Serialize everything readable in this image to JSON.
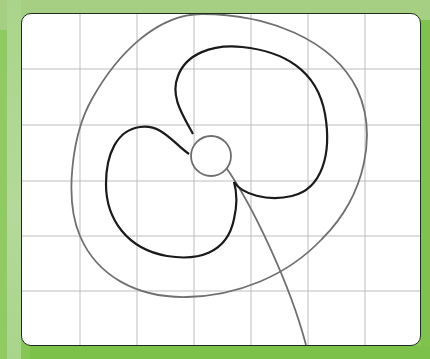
{
  "figure": {
    "colors": {
      "background": "#9ccd78",
      "background_dark": "#7fc34e",
      "card": "#ffffff",
      "card_border": "#1f2a1a",
      "grid": "#b8b8b8",
      "petal_stroke": "#1a1a1a",
      "oval_stroke": "#707070",
      "center_stroke": "#6e6e6e",
      "stem_stroke": "#707070"
    },
    "grid": {
      "vertical_lines_x": [
        58,
        115,
        172,
        229,
        286,
        343
      ],
      "horizontal_lines_y": [
        55,
        111,
        167,
        222,
        277
      ]
    },
    "shapes": {
      "oval": "outer-oval",
      "petals": [
        "top-right-petal",
        "left-petal"
      ],
      "center": "flower-center",
      "stem": "stem"
    }
  }
}
